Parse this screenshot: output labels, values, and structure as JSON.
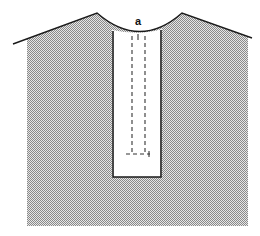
{
  "diagram": {
    "type": "sewing-pattern",
    "labels": {
      "point_a": "a"
    },
    "colors": {
      "fabric_fill": "#bdbdbd",
      "outline": "#1a1a1a",
      "background": "#ffffff",
      "placket_fill": "#ffffff"
    }
  }
}
